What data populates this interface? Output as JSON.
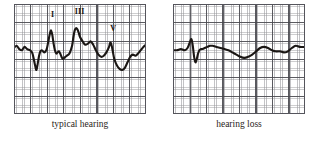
{
  "figure": {
    "title": "",
    "panel_count": 2
  },
  "panels": [
    {
      "id": "typical",
      "caption": "typical hearing",
      "peak_labels": [
        {
          "name": "I",
          "x": 28.0,
          "y": 6.0
        },
        {
          "name": "III",
          "x": 46.0,
          "y": 4.0
        },
        {
          "name": "V",
          "x": 73.0,
          "y": 19.0
        }
      ]
    },
    {
      "id": "loss",
      "caption": "hearing loss",
      "peak_labels": []
    }
  ],
  "chart_data": [
    {
      "type": "line",
      "title": "typical hearing",
      "xlabel": "",
      "ylabel": "",
      "xlim": [
        0,
        100
      ],
      "ylim": [
        0,
        100
      ],
      "grid": true,
      "legend": "none",
      "annotations": [
        {
          "text": "I",
          "x": 28,
          "y": 74
        },
        {
          "text": "III",
          "x": 46,
          "y": 80
        },
        {
          "text": "V",
          "x": 73,
          "y": 58
        }
      ],
      "series": [
        {
          "name": "ABR waveform - typical hearing",
          "x": [
            0,
            2,
            4,
            6,
            8,
            10,
            12,
            13,
            14,
            15,
            16,
            17,
            18,
            19,
            20,
            21,
            22,
            23,
            24,
            25,
            26,
            27,
            28,
            29,
            30,
            31,
            32,
            33,
            34,
            35,
            36,
            37,
            38,
            39,
            40,
            42,
            44,
            45,
            46,
            47,
            48,
            49,
            50,
            52,
            54,
            56,
            58,
            60,
            62,
            64,
            66,
            68,
            70,
            72,
            73,
            74,
            75,
            76,
            78,
            80,
            82,
            84,
            86,
            88,
            90,
            92,
            94,
            96,
            98,
            100
          ],
          "y": [
            60,
            62,
            59,
            58,
            61,
            59,
            58,
            57,
            55,
            50,
            44,
            40,
            46,
            53,
            57,
            58,
            57,
            56,
            57,
            60,
            66,
            72,
            76,
            72,
            64,
            58,
            55,
            56,
            57,
            55,
            52,
            50,
            51,
            52,
            53,
            55,
            62,
            70,
            76,
            78,
            77,
            74,
            70,
            66,
            63,
            64,
            66,
            63,
            58,
            54,
            52,
            53,
            56,
            61,
            65,
            62,
            56,
            50,
            44,
            41,
            40,
            42,
            47,
            52,
            54,
            53,
            55,
            58,
            61,
            63
          ]
        }
      ]
    },
    {
      "type": "line",
      "title": "hearing loss",
      "xlabel": "",
      "ylabel": "",
      "xlim": [
        0,
        100
      ],
      "ylim": [
        0,
        100
      ],
      "grid": true,
      "legend": "none",
      "annotations": [],
      "series": [
        {
          "name": "ABR waveform - hearing loss",
          "x": [
            0,
            3,
            6,
            9,
            11,
            13,
            14,
            15,
            16,
            17,
            18,
            19,
            20,
            21,
            22,
            24,
            26,
            28,
            30,
            33,
            36,
            39,
            42,
            45,
            48,
            51,
            54,
            57,
            60,
            63,
            66,
            69,
            72,
            75,
            78,
            81,
            84,
            87,
            90,
            93,
            96,
            100
          ],
          "y": [
            58,
            58,
            59,
            58,
            60,
            66,
            68,
            62,
            52,
            47,
            50,
            55,
            58,
            59,
            59,
            60,
            61,
            62,
            62,
            61,
            60,
            59,
            58,
            56,
            54,
            52,
            51,
            52,
            54,
            57,
            60,
            61,
            60,
            58,
            57,
            57,
            56,
            57,
            60,
            62,
            61,
            61
          ]
        }
      ]
    }
  ]
}
